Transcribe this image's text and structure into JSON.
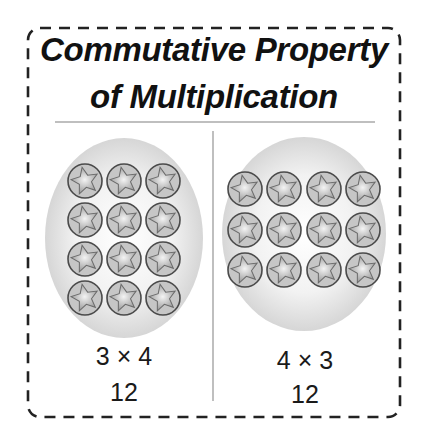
{
  "title": {
    "line1": "Commutative Property",
    "line2": "of Multiplication"
  },
  "left_panel": {
    "expression": "3 × 4",
    "product": "12",
    "columns": 3,
    "rows": 4
  },
  "right_panel": {
    "expression": "4 × 3",
    "product": "12",
    "columns": 4,
    "rows": 3
  },
  "colors": {
    "border": "#222222",
    "rule": "#aaaaaa",
    "ellipse": "#d9d9d9",
    "counter_fill": "#c8c8c8",
    "counter_stroke": "#555555"
  }
}
